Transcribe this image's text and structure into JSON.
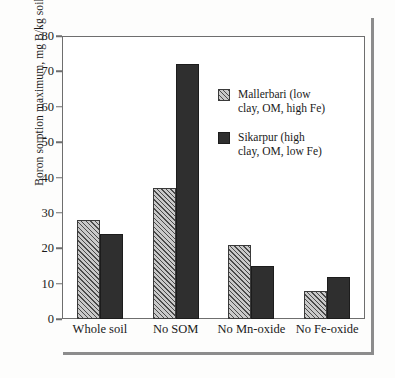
{
  "chart_data": {
    "type": "bar",
    "title": "",
    "xlabel": "",
    "ylabel": "Boron sorption maximum, mg B/kg soil",
    "ylim": [
      0,
      80
    ],
    "yticks": [
      0,
      10,
      20,
      30,
      40,
      50,
      60,
      70,
      80
    ],
    "grid": false,
    "legend_position": "inside-upper-right",
    "categories": [
      "Whole soil",
      "No SOM",
      "No Mn-oxide",
      "No Fe-oxide"
    ],
    "series": [
      {
        "name": "Mallerbari (low clay, OM, high Fe)",
        "name_line1": "Mallerbari (low",
        "name_line2": "clay, OM, high Fe)",
        "style": "hatched",
        "color": "#9a9a9a",
        "values": [
          28,
          37,
          21,
          8
        ]
      },
      {
        "name": "Sikarpur (high clay, OM, low Fe)",
        "name_line1": "Sikarpur (high",
        "name_line2": "clay, OM, low Fe)",
        "style": "solid",
        "color": "#2f2f2f",
        "values": [
          24,
          72,
          15,
          12
        ]
      }
    ]
  },
  "axis": {
    "y_title": "Boron sorption maximum, mg B/kg soil",
    "tick_labels": [
      "80",
      "70",
      "60",
      "50",
      "40",
      "30",
      "20",
      "10",
      "0"
    ]
  },
  "legend": {
    "entries": [
      {
        "label": "Mallerbari (low\nclay, OM, high Fe)",
        "swatch": "hatched-swatch"
      },
      {
        "label": "Sikarpur (high\nclay, OM, low Fe)",
        "swatch": "solid-swatch"
      }
    ]
  },
  "colors": {
    "hatch_fill": "#9a9a9a",
    "solid_fill": "#2f2f2f",
    "frame": "#6e6e6e",
    "outer_rule": "#8c8c8c",
    "background": "#fdfdfc"
  }
}
